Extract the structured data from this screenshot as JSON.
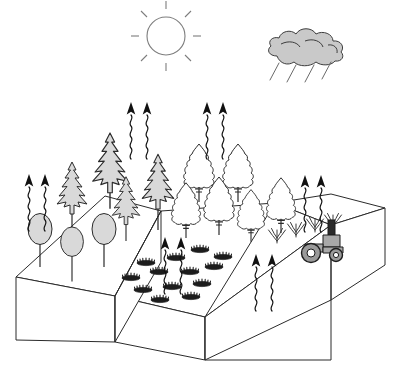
{
  "figure": {
    "title": "Isometric land-use blocks with vegetation and carbon flux arrows",
    "background_color": "#ffffff",
    "width": 398,
    "height": 385,
    "line_color": "#2b2b2b"
  },
  "sky": {
    "sun": {
      "icon": "sun-icon",
      "label": "Sun",
      "center_x": 166,
      "center_y": 36,
      "radius": 19,
      "ray_count": 8,
      "stroke_color": "#7d7d7d",
      "fill_color": "#ffffff"
    },
    "cloud": {
      "icon": "rain-cloud-icon",
      "label": "Rain cloud",
      "center_x": 305,
      "center_y": 55,
      "fill_color": "#c9c9c9",
      "stroke_color": "#3d3d3d",
      "rain_streak_count": 4
    }
  },
  "blocks": [
    {
      "id": "left-block",
      "label": "Forest block",
      "top_fill": "#ffffff",
      "front_fill": "#ffffff",
      "side_fill": "#ffffff"
    },
    {
      "id": "middle-block",
      "label": "Woodland and shrubland block",
      "top_fill": "#ffffff",
      "front_fill": "#ffffff",
      "side_fill": "#ffffff"
    },
    {
      "id": "right-block",
      "label": "Cropland block",
      "top_fill": "#ffffff",
      "front_fill": "#ffffff",
      "side_fill": "#ffffff"
    }
  ],
  "vegetation": {
    "conifers": {
      "icon": "conifer-tree-icon",
      "label": "Gray conifer trees",
      "count": 4,
      "fill_color": "#d9d9d9",
      "positions": [
        {
          "x": 72,
          "y": 196,
          "scale": 1.0
        },
        {
          "x": 110,
          "y": 172,
          "scale": 1.15
        },
        {
          "x": 126,
          "y": 208,
          "scale": 0.92
        },
        {
          "x": 158,
          "y": 190,
          "scale": 1.05
        }
      ]
    },
    "broadleaf_filled": {
      "icon": "broadleaf-tree-icon",
      "label": "Gray broadleaf trees",
      "count": 3,
      "fill_color": "#d9d9d9",
      "positions": [
        {
          "x": 40,
          "y": 243,
          "scale": 1.0
        },
        {
          "x": 72,
          "y": 255,
          "scale": 0.95
        },
        {
          "x": 104,
          "y": 243,
          "scale": 1.0
        }
      ]
    },
    "broadleaf_open": {
      "icon": "broadleaf-outline-tree-icon",
      "label": "Outlined broadleaf trees",
      "count": 6,
      "fill_color": "#ffffff",
      "positions": [
        {
          "x": 199,
          "y": 180,
          "scale": 1.0
        },
        {
          "x": 238,
          "y": 180,
          "scale": 1.0
        },
        {
          "x": 186,
          "y": 217,
          "scale": 0.95
        },
        {
          "x": 219,
          "y": 213,
          "scale": 1.0
        },
        {
          "x": 251,
          "y": 222,
          "scale": 0.9
        },
        {
          "x": 281,
          "y": 212,
          "scale": 0.95
        }
      ]
    },
    "shrubs": {
      "icon": "shrub-icon",
      "label": "Dark low shrubs",
      "count": 13,
      "fill_color": "#1d1d1d",
      "positions": [
        {
          "x": 146,
          "y": 263
        },
        {
          "x": 176,
          "y": 258
        },
        {
          "x": 200,
          "y": 250
        },
        {
          "x": 223,
          "y": 257
        },
        {
          "x": 131,
          "y": 278
        },
        {
          "x": 159,
          "y": 272
        },
        {
          "x": 190,
          "y": 272
        },
        {
          "x": 214,
          "y": 267
        },
        {
          "x": 143,
          "y": 290
        },
        {
          "x": 172,
          "y": 287
        },
        {
          "x": 202,
          "y": 284
        },
        {
          "x": 160,
          "y": 300
        },
        {
          "x": 191,
          "y": 297
        }
      ]
    },
    "crop_tufts": {
      "icon": "crop-tuft-icon",
      "label": "Crop tufts",
      "count": 4,
      "stroke_color": "#3a3a3a",
      "positions": [
        {
          "x": 277,
          "y": 243
        },
        {
          "x": 296,
          "y": 237
        },
        {
          "x": 315,
          "y": 232
        },
        {
          "x": 333,
          "y": 228
        }
      ]
    }
  },
  "flux_arrows": {
    "icon": "wavy-flux-arrow-icon",
    "label": "Wavy carbon flux arrows pointing upward",
    "stroke_color": "#111111",
    "groups": [
      {
        "id": "flux-left-forest",
        "count": 2,
        "x": 36,
        "y": 185
      },
      {
        "id": "flux-conifer-canopy",
        "count": 2,
        "x": 136,
        "y": 113
      },
      {
        "id": "flux-broadleaf-canopy",
        "count": 2,
        "x": 212,
        "y": 113
      },
      {
        "id": "flux-shrubland",
        "count": 2,
        "x": 171,
        "y": 248
      },
      {
        "id": "flux-cropland-edge",
        "count": 2,
        "x": 311,
        "y": 186
      },
      {
        "id": "flux-cropland-face",
        "count": 2,
        "x": 261,
        "y": 265
      }
    ]
  },
  "machinery": {
    "tractor": {
      "icon": "tractor-icon",
      "label": "Tractor",
      "x": 325,
      "y": 248,
      "body_color": "#a8a8a8",
      "stack_color": "#2a2a2a",
      "wheel_color": "#9a9a9a",
      "wheel_count": 2
    }
  }
}
